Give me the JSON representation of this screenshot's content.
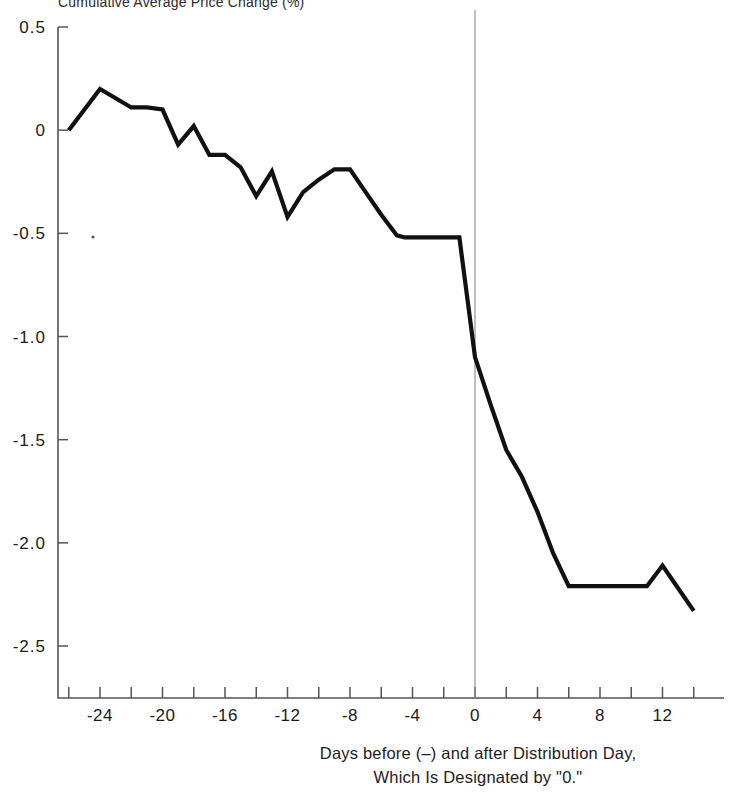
{
  "figure": {
    "y_axis_title": "Cumulative Average Price Change (%)",
    "caption_line1": "Days before (–) and after Distribution Day,",
    "caption_line2": "Which Is Designated by \"0.\"",
    "line_color": "#111111",
    "axis_color": "#555555",
    "event_line_color": "#8a8a8a"
  },
  "chart_data": {
    "type": "line",
    "title": "Cumulative Average Price Change (%)",
    "xlabel": "Days before (–) and after Distribution Day, Which Is Designated by \"0.\"",
    "ylabel": "Cumulative Average Price Change (%)",
    "xlim": [
      -26.7,
      15.0
    ],
    "ylim": [
      -2.75,
      0.5
    ],
    "grid": false,
    "legend": null,
    "y_ticks": [
      0.5,
      0,
      -0.5,
      -1.0,
      -1.5,
      -2.0,
      -2.5
    ],
    "y_tick_labels": [
      "0.5",
      "0",
      "-0.5",
      "-1.0",
      "-1.5",
      "-2.0",
      "-2.5"
    ],
    "x_ticks": [
      -26,
      -24,
      -22,
      -20,
      -18,
      -16,
      -14,
      -12,
      -10,
      -8,
      -6,
      -4,
      -2,
      0,
      2,
      4,
      6,
      8,
      10,
      12,
      14
    ],
    "x_tick_labels": [
      "-24",
      "-20",
      "-16",
      "-12",
      "-8",
      "-4",
      "0",
      "4",
      "8",
      "12"
    ],
    "x_labeled_ticks": [
      -24,
      -20,
      -16,
      -12,
      -8,
      -4,
      0,
      4,
      8,
      12
    ],
    "annotations": [
      {
        "label": "event-day-vertical-line",
        "x": 0
      }
    ],
    "series": [
      {
        "name": "Cumulative Average Price Change",
        "x": [
          -26,
          -24,
          -22,
          -21,
          -20,
          -19,
          -18,
          -17,
          -16,
          -15,
          -14,
          -13,
          -12,
          -11,
          -10,
          -9,
          -8,
          -7,
          -6,
          -5,
          -4.5,
          -3,
          -1,
          0,
          1,
          2,
          3,
          4,
          5,
          6,
          7,
          8,
          9,
          10,
          11,
          12,
          13,
          14
        ],
        "y": [
          0.0,
          0.2,
          0.11,
          0.11,
          0.1,
          -0.07,
          0.02,
          -0.12,
          -0.12,
          -0.18,
          -0.32,
          -0.2,
          -0.42,
          -0.3,
          -0.24,
          -0.19,
          -0.19,
          -0.3,
          -0.41,
          -0.51,
          -0.52,
          -0.52,
          -0.52,
          -1.1,
          -1.33,
          -1.55,
          -1.68,
          -1.85,
          -2.05,
          -2.21,
          -2.21,
          -2.21,
          -2.21,
          -2.21,
          -2.21,
          -2.11,
          -2.22,
          -2.33
        ]
      }
    ]
  }
}
